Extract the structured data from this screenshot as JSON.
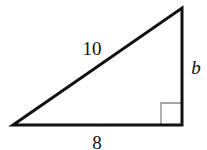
{
  "diagram": {
    "type": "right-triangle",
    "vertices": {
      "left": {
        "x": 13,
        "y": 125
      },
      "top_right": {
        "x": 182,
        "y": 8
      },
      "right_angle": {
        "x": 182,
        "y": 125
      }
    },
    "sides": {
      "hypotenuse": {
        "label": "10",
        "label_pos": {
          "x": 92,
          "y": 55
        }
      },
      "vertical_leg": {
        "label": "b",
        "label_pos": {
          "x": 196,
          "y": 75
        },
        "italic": true
      },
      "horizontal_leg": {
        "label": "8",
        "label_pos": {
          "x": 97,
          "y": 148
        }
      }
    },
    "right_angle_marker": {
      "size": 21
    },
    "colors": {
      "stroke": "#111111",
      "marker_stroke": "#888888",
      "background": "#ffffff"
    }
  }
}
